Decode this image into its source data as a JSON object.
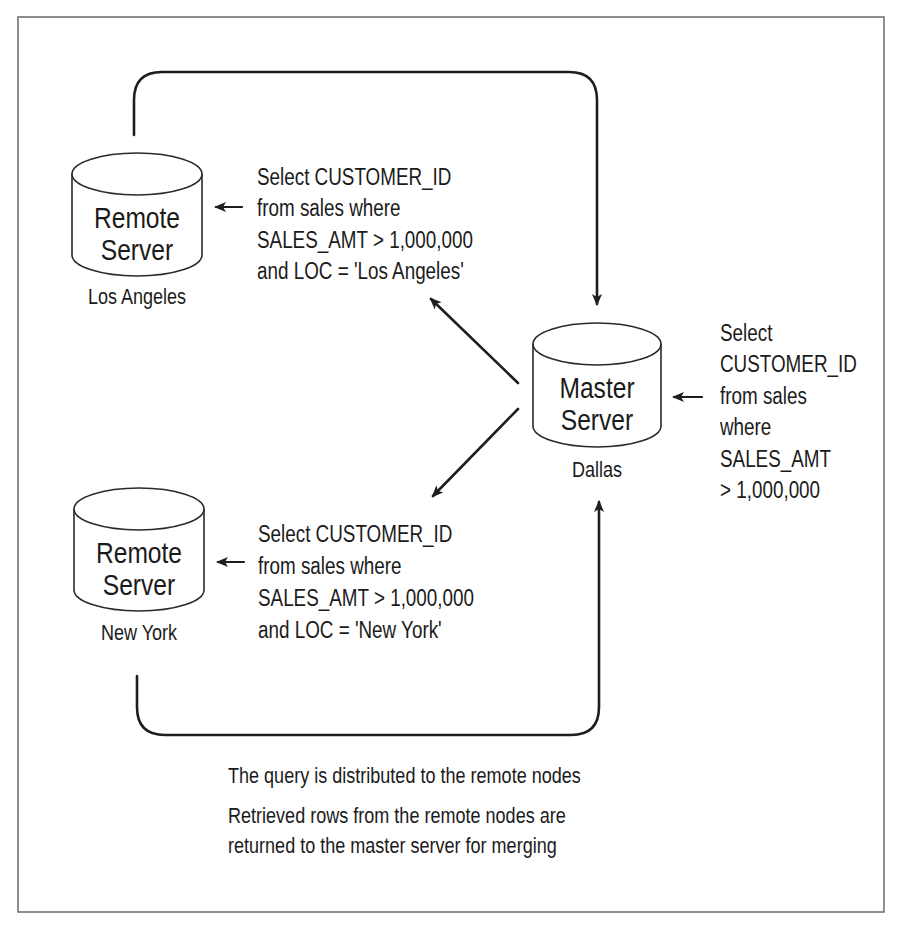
{
  "diagram": {
    "type": "distributed-query-flow",
    "nodes": [
      {
        "id": "la",
        "title_lines": [
          "Remote",
          "Server"
        ],
        "location": "Los Angeles"
      },
      {
        "id": "ny",
        "title_lines": [
          "Remote",
          "Server"
        ],
        "location": "New York"
      },
      {
        "id": "master",
        "title_lines": [
          "Master",
          "Server"
        ],
        "location": "Dallas"
      }
    ],
    "queries": {
      "la": [
        "Select CUSTOMER_ID",
        "from sales where",
        "SALES_AMT > 1,000,000",
        "and LOC = 'Los Angeles'"
      ],
      "ny": [
        "Select CUSTOMER_ID",
        "from sales where",
        "SALES_AMT > 1,000,000",
        "and LOC = 'New York'"
      ],
      "master": [
        "Select",
        "CUSTOMER_ID",
        "from sales",
        "where",
        "SALES_AMT",
        "> 1,000,000"
      ]
    },
    "edges": [
      {
        "from": "master",
        "to": "la",
        "meaning": "query distributed"
      },
      {
        "from": "master",
        "to": "ny",
        "meaning": "query distributed"
      },
      {
        "from": "la",
        "to": "master",
        "meaning": "rows returned"
      },
      {
        "from": "ny",
        "to": "master",
        "meaning": "rows returned"
      }
    ],
    "captions": [
      [
        "The query is distributed to the remote nodes"
      ],
      [
        "Retrieved rows from the remote nodes are",
        "returned to the master server for merging"
      ]
    ]
  }
}
